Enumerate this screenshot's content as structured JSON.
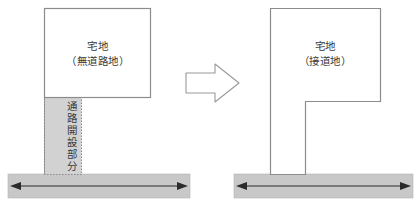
{
  "diagram": {
    "title_text_absent": "",
    "left_panel": {
      "plot_label_line1": "宅地",
      "plot_label_line2": "（無道路地）",
      "corridor_label": "通路開設部分",
      "road_band_color": "#c8c8c8",
      "plot_outline_color": "#8c8c8c",
      "corridor_fill_color": "#d2d2d2",
      "corridor_border_style": "dotted"
    },
    "right_panel": {
      "plot_label_line1": "宅地",
      "plot_label_line2": "（接道地）",
      "road_band_color": "#c8c8c8",
      "plot_outline_color": "#8c8c8c"
    },
    "transform_arrow": {
      "direction": "right",
      "fill_color": "#ffffff",
      "stroke_color": "#9a9a9a"
    },
    "road_arrow": {
      "style": "double-headed",
      "color": "#2b2b2b"
    },
    "background_color": "#ffffff"
  }
}
